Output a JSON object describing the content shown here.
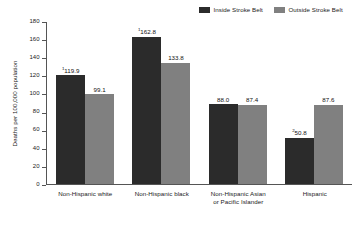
{
  "chart_data": {
    "type": "bar",
    "title": "",
    "subtitle": "",
    "xlabel": "",
    "ylabel": "Deaths per 100,000 population",
    "ylim": [
      0,
      180
    ],
    "yticks": [
      0,
      20,
      40,
      60,
      80,
      100,
      120,
      140,
      160,
      180
    ],
    "grid": false,
    "legend_position": "top-right",
    "categories": [
      "Non-Hispanic white",
      "Non-Hispanic black",
      "Non-Hispanic Asian or Pacific Islander",
      "Hispanic"
    ],
    "series": [
      {
        "name": "Inside Stroke Belt",
        "color": "#2b2b2b",
        "values": [
          119.9,
          162.8,
          88.0,
          50.8
        ],
        "labels": [
          "119.9",
          "162.8",
          "88.0",
          "50.8"
        ],
        "footnotes": [
          "1",
          "1",
          "",
          "2"
        ]
      },
      {
        "name": "Outside Stroke Belt",
        "color": "#808080",
        "values": [
          99.1,
          133.8,
          87.4,
          87.6
        ],
        "labels": [
          "99.1",
          "133.8",
          "87.4",
          "87.6"
        ],
        "footnotes": [
          "",
          "",
          "",
          ""
        ]
      }
    ]
  },
  "legend": {
    "items": [
      {
        "label": "Inside Stroke Belt",
        "color": "#2b2b2b"
      },
      {
        "label": "Outside Stroke Belt",
        "color": "#808080"
      }
    ]
  },
  "axis": {
    "y_title": "Deaths per 100,000 population",
    "y_tick_labels": [
      "180",
      "160",
      "140",
      "120",
      "100",
      "80",
      "60",
      "40",
      "20",
      "0"
    ]
  },
  "categories": [
    {
      "line1": "Non-Hispanic white",
      "line2": ""
    },
    {
      "line1": "Non-Hispanic black",
      "line2": ""
    },
    {
      "line1": "Non-Hispanic Asian",
      "line2": "or Pacific Islander"
    },
    {
      "line1": "Hispanic",
      "line2": ""
    }
  ]
}
